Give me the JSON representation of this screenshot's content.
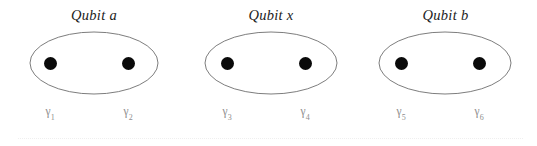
{
  "figure": {
    "width": 537,
    "height": 146,
    "background": "#ffffff",
    "type": "majorana-qubit-diagram",
    "outline_color": "#6e6e6e",
    "dot_color": "#0a0a0a",
    "label_color": "#8e8e8e",
    "title_color": "#1c1c1c",
    "rule_color": "#efefef"
  },
  "groups": [
    {
      "id": "qubit-a",
      "title": "Qubit a",
      "left": 29,
      "width": 130,
      "ellipse": {
        "cx": 65,
        "cy": 32,
        "rx": 64,
        "ry": 31
      },
      "dots": [
        {
          "name": "gamma-1",
          "cx": 21,
          "cy": 32
        },
        {
          "name": "gamma-2",
          "cx": 99,
          "cy": 32
        }
      ],
      "labels": [
        {
          "symbol": "γ",
          "subscript": "1",
          "x": 21
        },
        {
          "symbol": "γ",
          "subscript": "2",
          "x": 99
        }
      ]
    },
    {
      "id": "qubit-x",
      "title": "Qubit x",
      "left": 204,
      "width": 134,
      "ellipse": {
        "cx": 67,
        "cy": 32,
        "rx": 66,
        "ry": 31
      },
      "dots": [
        {
          "name": "gamma-3",
          "cx": 23,
          "cy": 32
        },
        {
          "name": "gamma-4",
          "cx": 101,
          "cy": 32
        }
      ],
      "labels": [
        {
          "symbol": "γ",
          "subscript": "3",
          "x": 23
        },
        {
          "symbol": "γ",
          "subscript": "4",
          "x": 101
        }
      ]
    },
    {
      "id": "qubit-b",
      "title": "Qubit b",
      "left": 378,
      "width": 135,
      "ellipse": {
        "cx": 67,
        "cy": 32,
        "rx": 66,
        "ry": 31
      },
      "dots": [
        {
          "name": "gamma-5",
          "cx": 23,
          "cy": 32
        },
        {
          "name": "gamma-6",
          "cx": 101,
          "cy": 32
        }
      ],
      "labels": [
        {
          "symbol": "γ",
          "subscript": "5",
          "x": 23
        },
        {
          "symbol": "γ",
          "subscript": "6",
          "x": 101
        }
      ]
    }
  ],
  "baseline_rule": {
    "visible": true,
    "style": "dotted"
  }
}
